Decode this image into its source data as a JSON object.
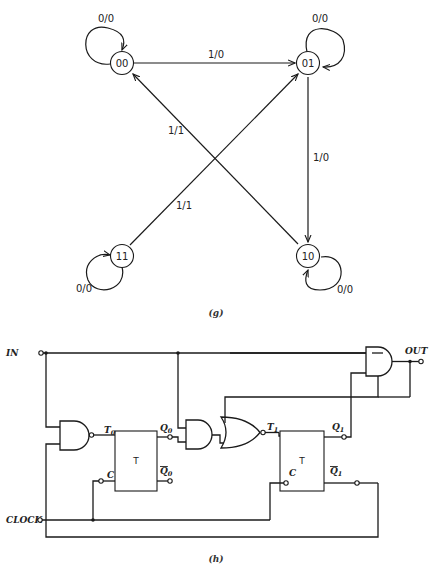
{
  "state_diagram": {
    "caption": "(g)",
    "states": [
      {
        "id": "00",
        "label": "00"
      },
      {
        "id": "01",
        "label": "01"
      },
      {
        "id": "10",
        "label": "10"
      },
      {
        "id": "11",
        "label": "11"
      }
    ],
    "transitions": [
      {
        "from": "00",
        "to": "00",
        "label": "0/0"
      },
      {
        "from": "00",
        "to": "01",
        "label": "1/0"
      },
      {
        "from": "01",
        "to": "01",
        "label": "0/0"
      },
      {
        "from": "01",
        "to": "10",
        "label": "1/0"
      },
      {
        "from": "10",
        "to": "10",
        "label": "0/0"
      },
      {
        "from": "10",
        "to": "00",
        "label": "1/1"
      },
      {
        "from": "11",
        "to": "11",
        "label": "0/0"
      },
      {
        "from": "11",
        "to": "01",
        "label": "1/1"
      }
    ]
  },
  "circuit": {
    "caption": "(h)",
    "inputs": {
      "in": "IN",
      "clock": "CLOCK"
    },
    "output": "OUT",
    "flipflops": [
      {
        "type": "T",
        "t_pin": "T",
        "t_sub": "0",
        "c_pin": "C",
        "q": "Q",
        "q_sub": "0",
        "qbar": "Q",
        "qbar_sub": "0"
      },
      {
        "type": "T",
        "t_pin": "T",
        "t_sub": "1",
        "c_pin": "C",
        "q": "Q",
        "q_sub": "1",
        "qbar": "Q",
        "qbar_sub": "1"
      }
    ]
  }
}
